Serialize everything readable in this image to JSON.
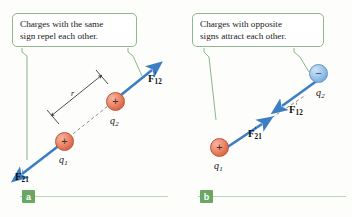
{
  "figure": {
    "background_color": "#fdfdfc",
    "accent_green": "#6aa664",
    "arrow_blue": "#3b7ec4",
    "positive_charge_color": "#dd6b4e",
    "negative_charge_color": "#7fb0e0",
    "dashed_line_color": "#8a8a8a"
  },
  "panels": [
    {
      "tag": "a",
      "callout": {
        "line1": "Charges with the same",
        "line2": "sign repel each other."
      },
      "charges": [
        {
          "name": "q1",
          "label": "q",
          "subscript": "1",
          "sign": "+",
          "polarity": "positive"
        },
        {
          "name": "q2",
          "label": "q",
          "subscript": "2",
          "sign": "+",
          "polarity": "positive"
        }
      ],
      "forces": [
        {
          "name": "F12",
          "symbol": "F",
          "subscript": "12",
          "vector": true
        },
        {
          "name": "F21",
          "symbol": "F",
          "subscript": "21",
          "vector": true
        }
      ],
      "separation": {
        "label": "r",
        "description": "distance between charges"
      }
    },
    {
      "tag": "b",
      "callout": {
        "line1": "Charges with opposite",
        "line2": "signs attract each other."
      },
      "charges": [
        {
          "name": "q1",
          "label": "q",
          "subscript": "1",
          "sign": "+",
          "polarity": "positive"
        },
        {
          "name": "q2",
          "label": "q",
          "subscript": "2",
          "sign": "−",
          "polarity": "negative"
        }
      ],
      "forces": [
        {
          "name": "F12",
          "symbol": "F",
          "subscript": "12",
          "vector": true
        },
        {
          "name": "F21",
          "symbol": "F",
          "subscript": "21",
          "vector": true
        }
      ]
    }
  ]
}
